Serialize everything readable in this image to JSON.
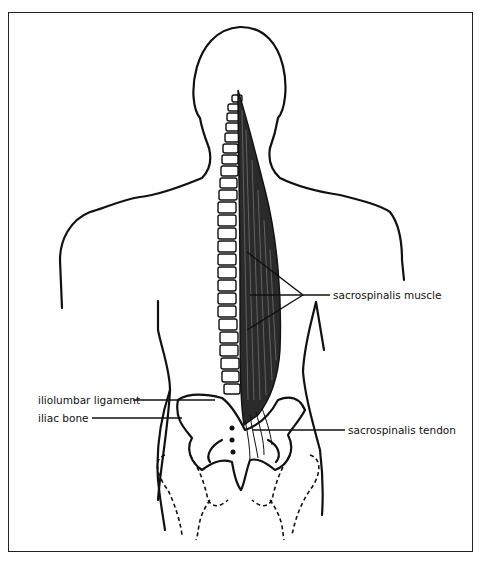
{
  "figure": {
    "labels": {
      "sacrospinalis_muscle": "sacrospinalis muscle",
      "iliolumbar_ligament": "iliolumbar ligament",
      "iliac_bone": "iliac bone",
      "sacrospinalis_tendon": "sacrospinalis tendon"
    },
    "colors": {
      "ink": "#111111",
      "background": "#ffffff",
      "frame": "#222222"
    }
  }
}
